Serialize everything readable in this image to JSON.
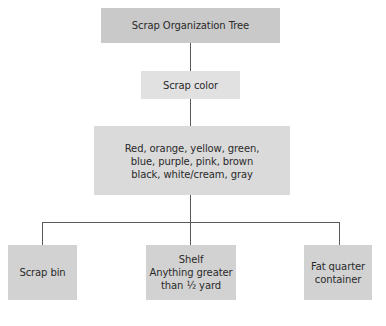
{
  "diagram": {
    "title": "Scrap Organization Tree",
    "level1": {
      "label": "Scrap color"
    },
    "level2": {
      "lines": [
        "Red, orange, yellow, green,",
        "blue, purple, pink, brown",
        "black, white/cream, gray"
      ]
    },
    "leaves": [
      {
        "lines": [
          "Scrap bin"
        ]
      },
      {
        "lines": [
          "Shelf",
          "Anything greater",
          "than ½ yard"
        ]
      },
      {
        "lines": [
          "Fat quarter",
          "container"
        ]
      }
    ]
  },
  "colors": {
    "title_box": "#c9c9c9",
    "level1_box": "#e1e1e1",
    "level2_box": "#dadada",
    "leaf_box": "#d2d2d2",
    "connector": "#5a5a5a"
  }
}
